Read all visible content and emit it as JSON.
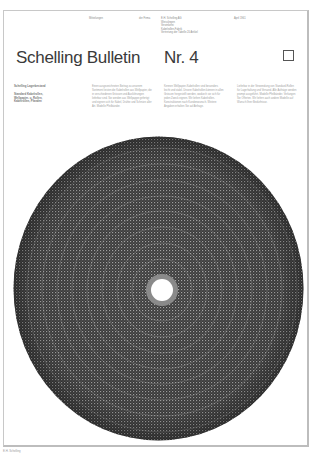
{
  "masthead": {
    "meta": [
      {
        "text": "Mitteilungen",
        "x": 88
      },
      {
        "text": "der Firma",
        "x": 138
      },
      {
        "text": "E.H. Schelling AG\nWeisslingen\nVerzinkerei\nKabelrollen-Fabrik\nVertretung der Tabelle 20 Artikel",
        "x": 160
      },
      {
        "text": "April 1961",
        "x": 233
      }
    ],
    "title": "Schelling Bulletin",
    "issue": "Nr. 4"
  },
  "sidebar": {
    "heading": "Schelling Lagerbestand",
    "lines": [
      "Standard Kabelrollen,",
      "Wellpapier- u. Rollen,",
      "Kabelrollen, Pfanden"
    ]
  },
  "columns": [
    "Einen ausgezeichneten Beitrag zu unserem Sortiment leisten die Kabelrollen aus Wellpapier, die in verschiedenen Grössen und Ausführungen lieferbar sind. Sie werden aus Wellpappe gefertigt und eignen sich für Kabel, Drähte und Schnüre aller Art. Modelle Pfeilbänder.",
    "Kennen Wellpapier-Kabelrollen sind besonders leicht und stabil. Unsere Kabelrollen können in allen Grössen hergestellt werden, wodurch sie sich für jeden Zweck eignen. Wir liefern Kabelrollen-Konstruktionen nach Kundenwunsch. Weitere Angaben erhalten Sie auf Anfrage.",
    "Lieferbar in der Verwendung von Standard-Rollen für Lagerhaltung und Versand. Alle Aufträge werden prompt ausgeführt. Modelle Pfeilbänder. Verlangen Sie Offerten. Wir liefern auch andere Modelle auf Wunsch Ihrer Bedürfnisse."
  ],
  "footer": {
    "text": "E.H. Schelling"
  },
  "colors": {
    "frame": "#c8c8c8",
    "disc_dark": "#3a3a3a",
    "disc_light": "#9a9a9a",
    "text": "#333333"
  }
}
